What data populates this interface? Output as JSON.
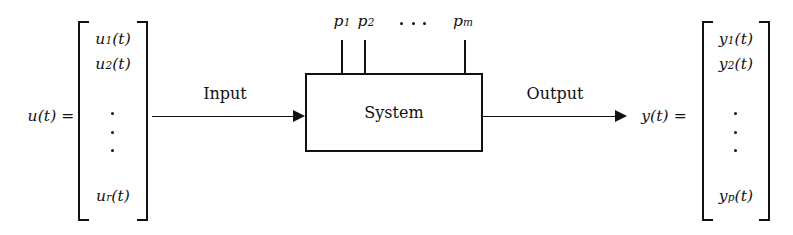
{
  "diagram": {
    "background_color": "#ffffff",
    "line_color": "#111111",
    "input_vector": {
      "label": "u(t) =",
      "elements": [
        {
          "base": "u",
          "sub": "1",
          "arg": "(t)"
        },
        {
          "base": "u",
          "sub": "2",
          "arg": "(t)"
        },
        {
          "base": "u",
          "sub": "r",
          "arg": "(t)"
        }
      ],
      "ellipsis": "vertical-dots"
    },
    "output_vector": {
      "label": "y(t) =",
      "elements": [
        {
          "base": "y",
          "sub": "1",
          "arg": "(t)"
        },
        {
          "base": "y",
          "sub": "2",
          "arg": "(t)"
        },
        {
          "base": "y",
          "sub": "p",
          "arg": "(t)"
        }
      ],
      "ellipsis": "vertical-dots"
    },
    "parameters": {
      "labels": [
        {
          "base": "p",
          "sub": "1"
        },
        {
          "base": "p",
          "sub": "2"
        },
        {
          "base": "p",
          "sub": "m"
        }
      ],
      "ellipsis": "horizontal-dots"
    },
    "block": {
      "label": "System"
    },
    "arrows": {
      "input_label": "Input",
      "output_label": "Output"
    }
  }
}
